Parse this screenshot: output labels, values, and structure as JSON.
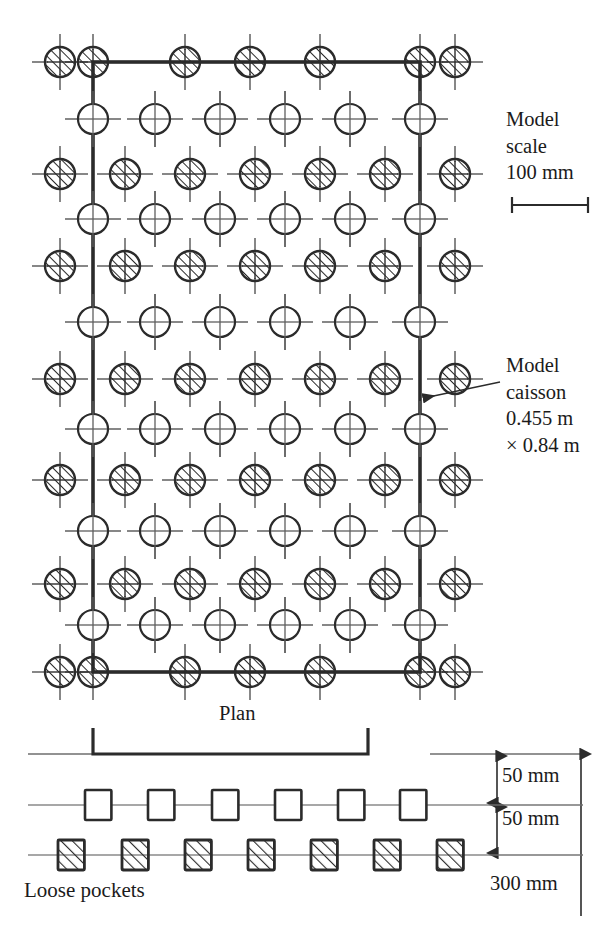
{
  "figure": {
    "plan_caption": "Plan",
    "loose_pockets_caption": "Loose pockets"
  },
  "annotations": {
    "model_scale": {
      "line1": "Model",
      "line2": "scale",
      "line3": "100 mm"
    },
    "model_caisson": {
      "line1": "Model",
      "line2": "caisson",
      "line3": "0.455 m",
      "line4": "× 0.84 m"
    }
  },
  "dimensions": {
    "upper_layer": "50 mm",
    "lower_layer": "50 mm",
    "total_depth": "300 mm"
  },
  "colors": {
    "ink": "#1b1b1b",
    "line": "#3a3a3a",
    "thin": "#6e6e6e",
    "background": "#ffffff"
  },
  "plan": {
    "caisson_rect": {
      "x": 93,
      "y": 62,
      "width": 327,
      "height": 610
    },
    "hatched_rows_y": [
      62,
      174,
      266,
      379,
      480,
      584,
      672
    ],
    "plain_rows_y": [
      119,
      219,
      322,
      429,
      531,
      625
    ],
    "hatched_cols_x": [
      60,
      125,
      190,
      255,
      320,
      385,
      455
    ],
    "plain_cols_x": [
      93,
      155,
      220,
      285,
      350,
      420
    ],
    "top_edge_hatched_cols_x": [
      60,
      93,
      185,
      250,
      320,
      420,
      455
    ],
    "circle_radius": 15,
    "tick_length": 13
  },
  "scale_bar": {
    "x1": 512,
    "x2": 588,
    "y": 205
  },
  "section": {
    "ground_line_y": 754,
    "bracket": {
      "x1": 93,
      "x2": 368,
      "y": 754,
      "tick_height": 26
    },
    "upper_squares_x": [
      85,
      148,
      212,
      275,
      338,
      400
    ],
    "upper_squares_y": 790,
    "lower_squares_x": [
      58,
      122,
      185,
      248,
      311,
      374,
      437
    ],
    "lower_squares_y": 840,
    "square_size": 30
  },
  "icons": {
    "hatched_circle": "hatched-circle-icon",
    "plain_circle": "plain-circle-icon",
    "open_square": "open-square-icon",
    "hatched_square": "hatched-square-icon",
    "arrow": "arrow-icon"
  }
}
